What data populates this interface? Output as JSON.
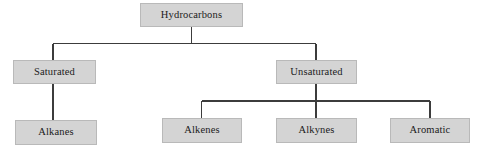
{
  "diagram": {
    "type": "tree-diagram",
    "colors": {
      "box_fill": "#d4d4d4",
      "box_border": "#b9b9b9",
      "connector": "#3c3c3c",
      "text": "#1b1b1b",
      "background": "#ffffff"
    },
    "nodes": {
      "root": {
        "label": "Hydrocarbons"
      },
      "saturated": {
        "label": "Saturated"
      },
      "unsaturated": {
        "label": "Unsaturated"
      },
      "alkanes": {
        "label": "Alkanes"
      },
      "alkenes": {
        "label": "Alkenes"
      },
      "alkynes": {
        "label": "Alkynes"
      },
      "aromatic": {
        "label": "Aromatic"
      }
    },
    "hierarchy": [
      {
        "label": "Hydrocarbons",
        "children": [
          {
            "label": "Saturated",
            "children": [
              {
                "label": "Alkanes",
                "children": []
              }
            ]
          },
          {
            "label": "Unsaturated",
            "children": [
              {
                "label": "Alkenes",
                "children": []
              },
              {
                "label": "Alkynes",
                "children": []
              },
              {
                "label": "Aromatic",
                "children": []
              }
            ]
          }
        ]
      }
    ]
  }
}
